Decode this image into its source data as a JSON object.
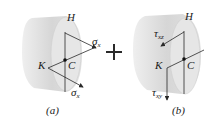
{
  "figure": {
    "panels": [
      {
        "id": "a",
        "caption": "(a)",
        "points": {
          "top": "H",
          "left": "K",
          "center": "C"
        },
        "stresses": [
          {
            "symbol": "σ",
            "subscript": "x",
            "at": "H",
            "direction": "normal, outward along shaft axis"
          },
          {
            "symbol": "σ",
            "subscript": "x",
            "at": "K",
            "direction": "normal, outward along shaft axis"
          }
        ]
      },
      {
        "id": "b",
        "caption": "(b)",
        "points": {
          "top": "H",
          "left": "K",
          "center": "C"
        },
        "stresses": [
          {
            "symbol": "τ",
            "subscript": "xz",
            "at": "H",
            "direction": "shear, pointing left-down"
          },
          {
            "symbol": "τ",
            "subscript": "xy",
            "at": "K",
            "direction": "shear, pointing down"
          }
        ]
      }
    ],
    "operator": "+",
    "colors": {
      "shaft": "#d9d9d9",
      "shaft_face": "#e8e8e8",
      "lines": "#2a2a2a",
      "text": "#1a1a1a"
    }
  }
}
